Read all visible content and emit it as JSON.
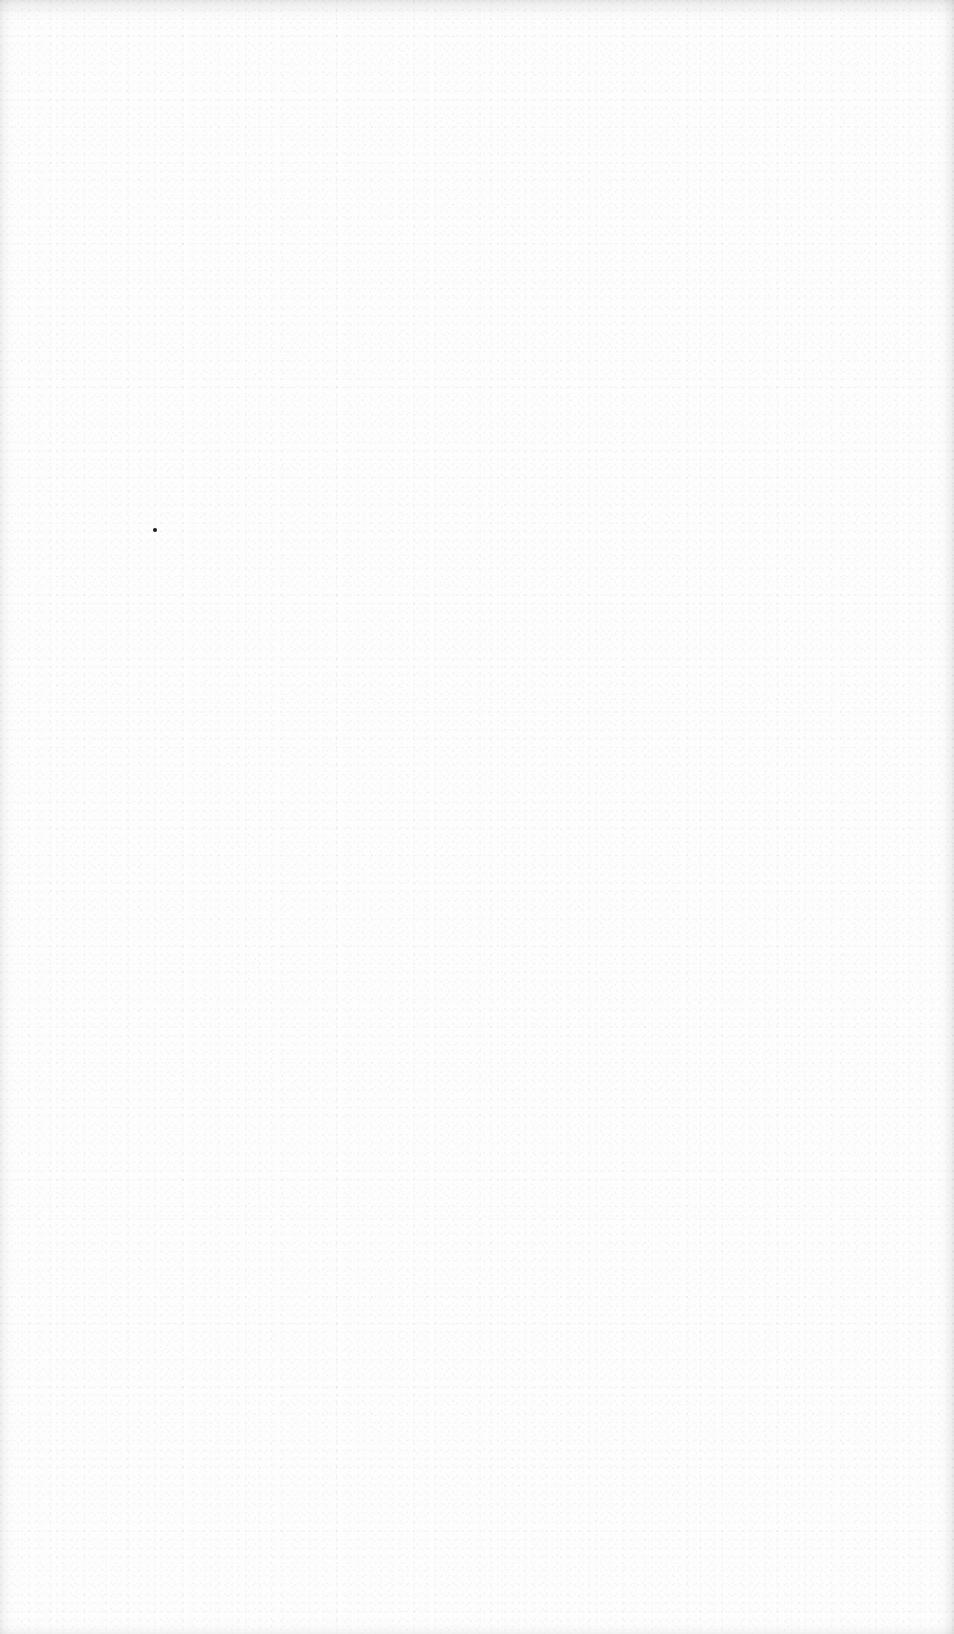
{
  "page": {
    "type": "blank scanned page",
    "background_color": "#fdfdfd",
    "edge_shading_color": "#e6e6e6",
    "marks": [
      {
        "name": "ink-dot",
        "x": 155,
        "y": 530,
        "size": 4,
        "color": "#1a1a1a"
      }
    ]
  }
}
